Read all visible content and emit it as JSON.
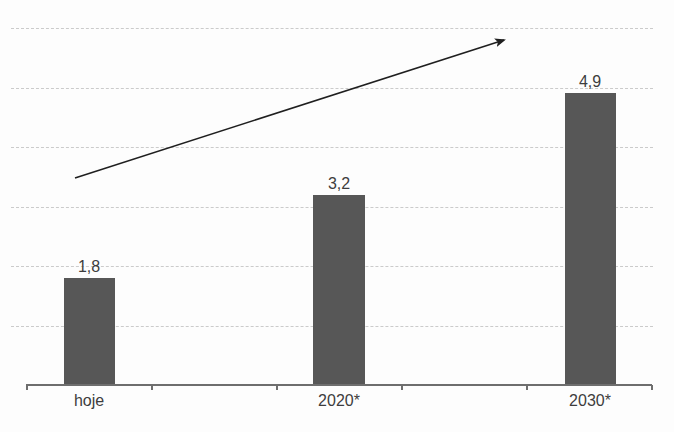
{
  "chart_data": {
    "type": "bar",
    "categories": [
      "hoje",
      "2020*",
      "2030*"
    ],
    "values": [
      1.8,
      3.2,
      4.9
    ],
    "value_labels": [
      "1,8",
      "3,2",
      "4,9"
    ],
    "title": "",
    "xlabel": "",
    "ylabel": "",
    "ylim": [
      0,
      6
    ],
    "gridline_units": [
      1,
      2,
      3,
      4,
      5,
      6
    ],
    "grid_style": "dashed",
    "legend_position": "none",
    "annotations": [
      {
        "type": "arrow",
        "meaning": "upward-trend"
      }
    ],
    "colors": {
      "bar": "#575757",
      "grid": "#cbcbcb",
      "axis": "#6e6e6e",
      "text": "#3d3d3d",
      "arrow": "#1f1f1f"
    }
  }
}
